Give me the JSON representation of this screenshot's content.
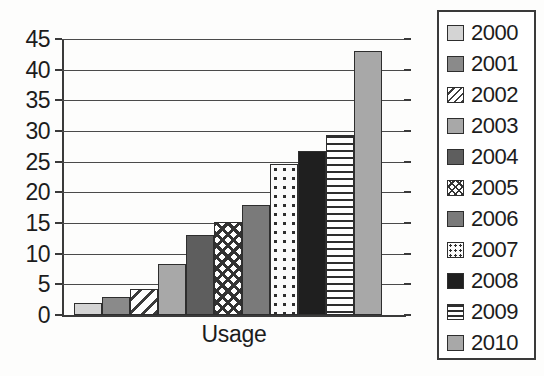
{
  "chart_data": {
    "type": "bar",
    "title": "",
    "xlabel": "Usage",
    "ylabel": "",
    "categories": [
      "Usage"
    ],
    "grid": true,
    "legend_position": "right",
    "ylim": [
      0,
      45
    ],
    "ytick_labels": [
      "45",
      "40",
      "35",
      "30",
      "25",
      "20",
      "15",
      "10",
      "5",
      "0"
    ],
    "ytick_values": [
      45,
      40,
      35,
      30,
      25,
      20,
      15,
      10,
      5,
      0
    ],
    "series": [
      {
        "name": "2000",
        "value": 2,
        "fill": "fill-lightgray",
        "swatch": "light-gray-swatch"
      },
      {
        "name": "2001",
        "value": 3,
        "fill": "fill-medgray",
        "swatch": "medium-gray-swatch"
      },
      {
        "name": "2002",
        "value": 4.3,
        "fill": "fill-diagonal",
        "swatch": "diagonal-stripe-swatch"
      },
      {
        "name": "2003",
        "value": 8.3,
        "fill": "fill-gray",
        "swatch": "gray-swatch"
      },
      {
        "name": "2004",
        "value": 13,
        "fill": "fill-darkgray",
        "swatch": "dark-gray-swatch"
      },
      {
        "name": "2005",
        "value": 15.2,
        "fill": "fill-crosshatch",
        "swatch": "crosshatch-swatch"
      },
      {
        "name": "2006",
        "value": 18,
        "fill": "fill-meddarkgray",
        "swatch": "medium-dark-gray-swatch"
      },
      {
        "name": "2007",
        "value": 24.7,
        "fill": "fill-dots",
        "swatch": "dotted-swatch"
      },
      {
        "name": "2008",
        "value": 26.8,
        "fill": "fill-nearblack",
        "swatch": "near-black-swatch"
      },
      {
        "name": "2009",
        "value": 29.3,
        "fill": "fill-hlines",
        "swatch": "horizontal-line-swatch"
      },
      {
        "name": "2010",
        "value": 43,
        "fill": "fill-gray",
        "swatch": "gray-swatch"
      }
    ]
  }
}
